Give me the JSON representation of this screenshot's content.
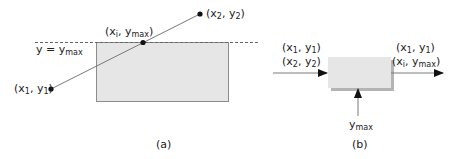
{
  "panel_a": {
    "caption": "(a)",
    "clip_line_label": "y = y",
    "clip_line_label_sub": "max",
    "point1": {
      "pre": "(x",
      "sub1": "1",
      "mid": ", y",
      "sub2": "1",
      "post": ")"
    },
    "point2": {
      "pre": "(x",
      "sub1": "2",
      "mid": ", y",
      "sub2": "2",
      "post": ")"
    },
    "intersection": {
      "pre": "(x",
      "sub1": "i",
      "mid": ", y",
      "sub2": "max",
      "post": ")"
    }
  },
  "panel_b": {
    "caption": "(b)",
    "input_1": {
      "pre": "(x",
      "sub1": "1",
      "mid": ", y",
      "sub2": "1",
      "post": ")"
    },
    "input_2": {
      "pre": "(x",
      "sub1": "2",
      "mid": ", y",
      "sub2": "2",
      "post": ")"
    },
    "output_1": {
      "pre": "(x",
      "sub1": "1",
      "mid": ", y",
      "sub2": "1",
      "post": ")"
    },
    "output_2": {
      "pre": "(x",
      "sub1": "i",
      "mid": ", y",
      "sub2": "max",
      "post": ")"
    },
    "bottom_input": {
      "pre": "y",
      "sub": "max"
    }
  },
  "colors": {
    "box_fill": "#e6e6e6",
    "box_stroke": "#8c8c8c",
    "shadow": "#b4b4b4",
    "line": "#7a7a7a",
    "ink": "#111111"
  }
}
